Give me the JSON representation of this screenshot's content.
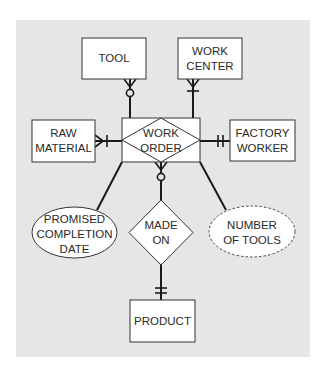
{
  "diagram": {
    "type": "entity-relationship",
    "background_color": "#e6e6e6",
    "line_color": "#1a1a1a",
    "entities": [
      {
        "id": "tool",
        "lines": [
          "TOOL"
        ]
      },
      {
        "id": "work_center",
        "lines": [
          "WORK",
          "CENTER"
        ]
      },
      {
        "id": "raw_material",
        "lines": [
          "RAW",
          "MATERIAL"
        ]
      },
      {
        "id": "factory_worker",
        "lines": [
          "FACTORY",
          "WORKER"
        ]
      },
      {
        "id": "product",
        "lines": [
          "PRODUCT"
        ]
      }
    ],
    "associative_entity": {
      "id": "work_order",
      "lines": [
        "WORK",
        "ORDER"
      ]
    },
    "relationship": {
      "id": "made_on",
      "lines": [
        "MADE",
        "ON"
      ]
    },
    "attributes": [
      {
        "id": "promised_completion_date",
        "lines": [
          "PROMISED",
          "COMPLETION",
          "DATE"
        ],
        "style": "solid"
      },
      {
        "id": "number_of_tools",
        "lines": [
          "NUMBER",
          "OF TOOLS"
        ],
        "style": "dashed"
      }
    ],
    "connections": [
      {
        "from": "work_order",
        "to": "tool",
        "end_notation": "zero-or-many"
      },
      {
        "from": "work_order",
        "to": "work_center",
        "end_notation": "one-or-many"
      },
      {
        "from": "work_order",
        "to": "raw_material",
        "end_notation": "one-or-many"
      },
      {
        "from": "work_order",
        "to": "factory_worker",
        "end_notation": "one-and-only-one"
      },
      {
        "from": "made_on",
        "to": "work_order",
        "end_notation": "zero-or-many"
      },
      {
        "from": "made_on",
        "to": "product",
        "end_notation": "one-and-only-one"
      },
      {
        "from": "work_order",
        "to": "promised_completion_date",
        "end_notation": "none"
      },
      {
        "from": "work_order",
        "to": "number_of_tools",
        "end_notation": "none"
      }
    ]
  }
}
